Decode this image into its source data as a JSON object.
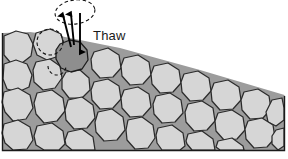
{
  "figure": {
    "label_thaw": "Thaw",
    "colors": {
      "background": "#ffffff",
      "matrix_fill": "#9c9c9c",
      "clast_fill": "#d6d6d6",
      "clast_stroke": "#2b2b2b",
      "thawed_clast_fill": "#8e8e8e",
      "frame_stroke": "#1a1a1a",
      "arrow_color": "#000000",
      "dashed_outline": "#111111",
      "text_color": "#1a1a1a"
    }
  },
  "diagram": {
    "type": "cross-section",
    "frame": {
      "left": 2.5,
      "right": 284.5,
      "bottom": 150.5
    },
    "matrix_polygon": "2.5,33 2.5,150.5 284.5,150.5 284.5,95 200,70 120,48 60,36 30,32",
    "dashed_ellipse": {
      "cx": 75,
      "cy": 12,
      "rx": 20,
      "ry": 12,
      "rotate": -8
    },
    "dashed_circle": {
      "cx": 50,
      "cy": 42,
      "r": 13
    },
    "dashed_arc_lower": {
      "cx": 57,
      "cy": 66,
      "r": 9
    },
    "arrows": [
      {
        "name": "uplift-arrow-left",
        "x1": 71,
        "y1": 47,
        "x2": 63,
        "y2": 15,
        "head": "up"
      },
      {
        "name": "uplift-arrow-center",
        "x1": 74,
        "y1": 45,
        "x2": 71,
        "y2": 14,
        "head": "up"
      },
      {
        "name": "settle-arrow-down",
        "x1": 80,
        "y1": 13,
        "x2": 80,
        "y2": 52,
        "head": "down"
      }
    ],
    "thawed_clast": "60,44 70,40 80,42 87,50 88,60 82,69 71,72 61,68 56,59 56,50",
    "clasts": [
      "4,36 16,31 28,34 33,44 31,56 22,63 10,62 4,55",
      "36,33 50,29 61,34 64,45 59,56 47,60 37,55 33,44",
      "4,64 16,60 27,64 32,75 29,87 18,92 7,89 3,79",
      "36,62 50,59 60,66 62,78 55,88 43,90 34,82 33,70",
      "66,72 80,70 89,78 90,90 82,98 69,98 62,89 62,79",
      "94,52 108,48 119,55 121,68 113,77 100,78 92,69 91,59",
      "124,58 138,55 149,62 151,75 143,84 130,85 122,76 121,66",
      "154,66 168,63 179,70 181,83 173,92 160,93 152,84 151,74",
      "184,74 198,71 209,78 211,91 203,100 190,101 182,92 181,82",
      "214,83 228,80 239,87 241,100 233,109 220,110 212,101 211,91",
      "244,92 258,89 269,96 271,109 263,118 250,119 242,110 241,100",
      "272,100 282,98 284,108 284,120 276,126 268,122 266,112",
      "94,82 108,79 119,86 121,99 113,108 100,109 92,100 91,90",
      "124,90 138,87 149,94 151,107 143,116 130,117 122,108 121,98",
      "156,96 170,93 181,100 183,113 175,122 162,123 154,114 153,104",
      "188,104 202,101 213,108 215,121 207,130 194,131 186,122 185,112",
      "218,113 232,110 243,117 245,130 237,139 224,140 216,131 215,121",
      "248,121 262,118 273,125 275,138 267,147 254,148 246,139 245,129",
      "4,92 18,88 30,95 33,108 26,119 13,121 5,112 2,102",
      "37,93 52,90 63,98 65,111 57,121 44,123 36,114 34,103",
      "68,100 82,97 93,105 95,118 87,128 74,129 66,120 65,110",
      "98,112 112,109 123,117 125,130 117,140 104,141 96,132 95,122",
      "128,120 142,117 153,125 155,138 148,148 135,149 127,140 126,130",
      "4,124 18,120 30,127 33,140 27,149 13,150 5,143 2,133",
      "37,126 52,123 63,131 65,144 59,150 44,150 36,145 34,136",
      "68,132 82,129 93,137 95,150 84,150 72,150 66,145 65,140",
      "158,128 172,125 183,133 185,146 180,150 162,150 157,143 156,135",
      "188,134 202,131 213,139 215,150 192,150 187,144 186,141",
      "218,141 232,138 243,146 244,150 220,150 216,147",
      "276,130 284,128 284,146 278,150 272,144 272,136"
    ]
  }
}
